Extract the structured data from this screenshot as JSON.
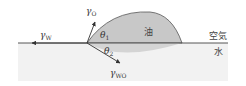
{
  "diagram": {
    "labels": {
      "gamma_w": {
        "symbol": "γ",
        "subscript": "W"
      },
      "gamma_o": {
        "symbol": "γ",
        "subscript": "O"
      },
      "gamma_wo": {
        "symbol": "γ",
        "subscript": "WO"
      },
      "theta_1": {
        "symbol": "θ",
        "subscript": "1"
      },
      "theta_2": {
        "symbol": "θ",
        "subscript": "2"
      },
      "oil": "油",
      "air": "空気",
      "water": "水"
    },
    "colors": {
      "oil_fill": "#c8c8c8",
      "water_fill": "#f2f2f2",
      "oil_below_fill": "#d4d4d4",
      "line": "#333333",
      "background": "#ffffff"
    }
  }
}
